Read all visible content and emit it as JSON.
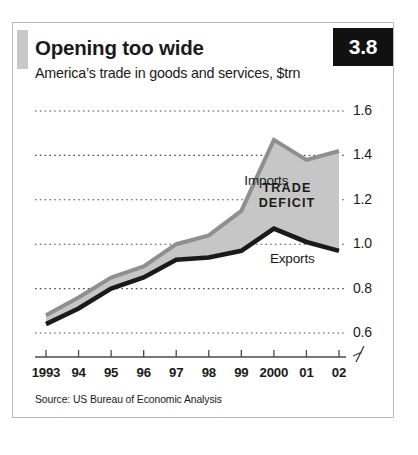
{
  "card": {
    "badge_label": "3.8",
    "title": "Opening too wide",
    "subtitle": "America’s trade in goods and services, $trn",
    "source": "Source: US Bureau of Economic Analysis",
    "accent_color": "#c8c8c8",
    "badge_bg": "#111111",
    "badge_fg": "#ffffff",
    "border_color": "#b9b9b9"
  },
  "chart_data": {
    "type": "line",
    "title": "Opening too wide",
    "subtitle": "America’s trade in goods and services, $trn",
    "xlabel": "",
    "ylabel": "$trn",
    "categories": [
      "1993",
      "94",
      "95",
      "96",
      "97",
      "98",
      "99",
      "2000",
      "01",
      "02"
    ],
    "x_tick_labels": [
      "1993",
      "94",
      "95",
      "96",
      "97",
      "98",
      "99",
      "2000",
      "01",
      "02"
    ],
    "y_tick_labels": [
      "1.6",
      "1.4",
      "1.2",
      "1.0",
      "0.8",
      "0.6"
    ],
    "y_ticks": [
      1.6,
      1.4,
      1.2,
      1.0,
      0.8,
      0.6
    ],
    "ylim": [
      0.6,
      1.6
    ],
    "y_axis_position": "right",
    "y_axis_broken": true,
    "grid": "horizontal-dotted",
    "legend": "inline-annotations",
    "series": [
      {
        "name": "Imports",
        "color": "#8f8f8f",
        "values": [
          0.68,
          0.76,
          0.85,
          0.9,
          1.0,
          1.04,
          1.15,
          1.47,
          1.38,
          1.42
        ]
      },
      {
        "name": "Exports",
        "color": "#1a1a1a",
        "values": [
          0.64,
          0.71,
          0.8,
          0.85,
          0.93,
          0.94,
          0.97,
          1.07,
          1.01,
          0.97
        ]
      }
    ],
    "band": {
      "name": "TRADE DEFICIT",
      "fill_color": "#c6c6c6",
      "between": [
        "Imports",
        "Exports"
      ]
    },
    "annotations": [
      {
        "text": "Imports",
        "series": "Imports",
        "position": "above"
      },
      {
        "text": "Exports",
        "series": "Exports",
        "position": "below"
      },
      {
        "text": "TRADE DEFICIT",
        "position": "inside-band"
      }
    ]
  }
}
